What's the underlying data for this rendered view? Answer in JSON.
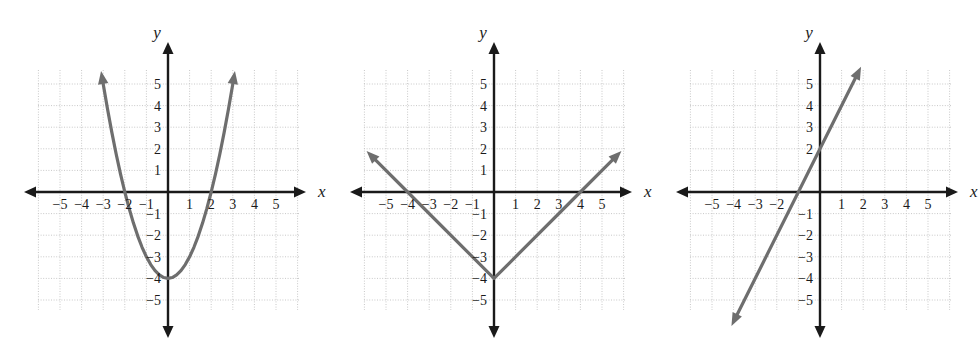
{
  "page": {
    "background_color": "#ffffff",
    "width": 978,
    "height": 354,
    "panel_count": 3
  },
  "style": {
    "axis_color": "#1a1a1a",
    "grid_color": "#c8c8c8",
    "curve_color": "#6e6e6e",
    "label_color": "#1a1a1a"
  },
  "axis_labels": {
    "x": "x",
    "y": "y"
  },
  "ticks": {
    "x": [
      "-5",
      "-4",
      "-3",
      "-2",
      "-1",
      "1",
      "2",
      "3",
      "4",
      "5"
    ],
    "y": [
      "5",
      "4",
      "3",
      "2",
      "1",
      "-1",
      "-2",
      "-3",
      "-4",
      "-5"
    ]
  },
  "chart_data": [
    {
      "type": "line",
      "name": "graph-1-parabola",
      "title": "",
      "xlabel": "x",
      "ylabel": "y",
      "xlim": [
        -6,
        6
      ],
      "ylim": [
        -6,
        6
      ],
      "grid": true,
      "xticks": [
        -5,
        -4,
        -3,
        -2,
        -1,
        1,
        2,
        3,
        4,
        5
      ],
      "yticks": [
        5,
        4,
        3,
        2,
        1,
        -1,
        -2,
        -3,
        -4,
        -5
      ],
      "xtick_labels": [
        "-5",
        "-4",
        "-3",
        "-2",
        "-1",
        "1",
        "2",
        "3",
        "4",
        "5"
      ],
      "ytick_labels": [
        "5",
        "4",
        "3",
        "2",
        "1",
        "-1",
        "-2",
        "-3",
        "-4",
        "-5"
      ],
      "curve_shape": "parabola",
      "equation": "y = x^2 - 4",
      "vertex": [
        0,
        -4
      ],
      "x_intercepts": [
        -2,
        2
      ],
      "y_intercept": -4,
      "arrow_start": true,
      "arrow_end": true,
      "points": [
        [
          -3.1,
          5.6
        ],
        [
          -3.0,
          5.0
        ],
        [
          -2.8,
          3.84
        ],
        [
          -2.6,
          2.76
        ],
        [
          -2.4,
          1.76
        ],
        [
          -2.2,
          0.84
        ],
        [
          -2.0,
          0.0
        ],
        [
          -1.8,
          -0.76
        ],
        [
          -1.6,
          -1.44
        ],
        [
          -1.4,
          -2.04
        ],
        [
          -1.2,
          -2.56
        ],
        [
          -1.0,
          -3.0
        ],
        [
          -0.8,
          -3.36
        ],
        [
          -0.6,
          -3.64
        ],
        [
          -0.4,
          -3.84
        ],
        [
          -0.2,
          -3.96
        ],
        [
          0.0,
          -4.0
        ],
        [
          0.2,
          -3.96
        ],
        [
          0.4,
          -3.84
        ],
        [
          0.6,
          -3.64
        ],
        [
          0.8,
          -3.36
        ],
        [
          1.0,
          -3.0
        ],
        [
          1.2,
          -2.56
        ],
        [
          1.4,
          -2.04
        ],
        [
          1.6,
          -1.44
        ],
        [
          1.8,
          -0.76
        ],
        [
          2.0,
          0.0
        ],
        [
          2.2,
          0.84
        ],
        [
          2.4,
          1.76
        ],
        [
          2.6,
          2.76
        ],
        [
          2.8,
          3.84
        ],
        [
          3.0,
          5.0
        ],
        [
          3.1,
          5.6
        ]
      ]
    },
    {
      "type": "line",
      "name": "graph-2-absolute-value",
      "title": "",
      "xlabel": "x",
      "ylabel": "y",
      "xlim": [
        -6,
        6
      ],
      "ylim": [
        -6,
        6
      ],
      "grid": true,
      "xticks": [
        -5,
        -4,
        -3,
        -2,
        -1,
        1,
        2,
        3,
        4,
        5
      ],
      "yticks": [
        5,
        4,
        3,
        2,
        1,
        -1,
        -2,
        -3,
        -4,
        -5
      ],
      "xtick_labels": [
        "-5",
        "-4",
        "-3",
        "-2",
        "-1",
        "1",
        "2",
        "3",
        "4",
        "5"
      ],
      "ytick_labels": [
        "5",
        "4",
        "3",
        "2",
        "1",
        "-1",
        "-2",
        "-3",
        "-4",
        "-5"
      ],
      "curve_shape": "v-shape",
      "equation": "y = |x| - 4",
      "vertex": [
        0,
        -4
      ],
      "x_intercepts": [
        -4,
        4
      ],
      "y_intercept": -4,
      "arrow_start": true,
      "arrow_end": true,
      "points": [
        [
          -5.9,
          1.9
        ],
        [
          -4.0,
          0.0
        ],
        [
          0.0,
          -4.0
        ],
        [
          4.0,
          0.0
        ],
        [
          5.9,
          1.9
        ]
      ]
    },
    {
      "type": "line",
      "name": "graph-3-linear",
      "title": "",
      "xlabel": "x",
      "ylabel": "y",
      "xlim": [
        -6,
        6
      ],
      "ylim": [
        -6,
        6
      ],
      "grid": true,
      "xticks": [
        -5,
        -4,
        -3,
        -2,
        1,
        2,
        3,
        4,
        5
      ],
      "yticks": [
        5,
        4,
        3,
        2,
        -1,
        -2,
        -3,
        -4,
        -5
      ],
      "xtick_labels": [
        "-5",
        "-4",
        "-3",
        "-2",
        "1",
        "2",
        "3",
        "4",
        "5"
      ],
      "ytick_labels": [
        "5",
        "4",
        "3",
        "2",
        "-1",
        "-2",
        "-3",
        "-4",
        "-5"
      ],
      "curve_shape": "straight-line",
      "equation": "y = 2x + 2",
      "slope": 2,
      "x_intercepts": [
        -1
      ],
      "y_intercept": 2,
      "arrow_start": true,
      "arrow_end": true,
      "points": [
        [
          -4.1,
          -6.2
        ],
        [
          0.0,
          2.0
        ],
        [
          1.9,
          5.8
        ]
      ]
    }
  ]
}
